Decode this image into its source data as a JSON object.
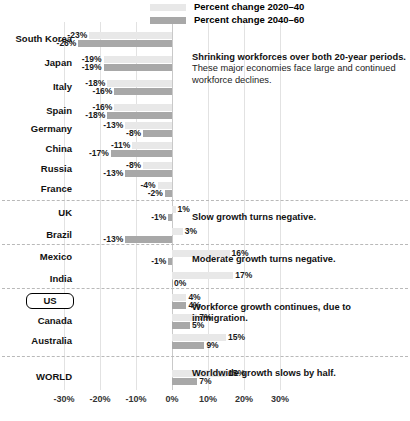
{
  "legend": {
    "items": [
      {
        "label": "Percent change 2020–40",
        "color": "#e8e8e8",
        "key": "s1"
      },
      {
        "label": "Percent change 2040–60",
        "color": "#a8a8a8",
        "key": "s2"
      }
    ]
  },
  "axis": {
    "ticks": [
      "-30%",
      "-20%",
      "-10%",
      "0%",
      "10%",
      "20%",
      "30%"
    ],
    "tick_values": [
      -30,
      -20,
      -10,
      0,
      10,
      20,
      30
    ]
  },
  "annotations": [
    {
      "id": "shrinking",
      "title": "Shrinking workforces over both 20-year periods.",
      "body": "These major economies face large and continued workforce declines."
    },
    {
      "id": "slow-growth",
      "title": "Slow growth turns negative.",
      "body": ""
    },
    {
      "id": "moderate-growth",
      "title": "Moderate growth turns negative.",
      "body": ""
    },
    {
      "id": "workforce-growth",
      "title": "Workforce growth continues, due to immigration.",
      "body": ""
    },
    {
      "id": "worldwide",
      "title": "Worldwide growth slows by half.",
      "body": ""
    }
  ],
  "chart_data": {
    "type": "bar",
    "orientation": "horizontal",
    "title": "",
    "xlabel": "",
    "ylabel": "",
    "xlim": [
      -30,
      35
    ],
    "grid": true,
    "legend_position": "top",
    "categories": [
      "South Korea",
      "Japan",
      "Italy",
      "Spain",
      "Germany",
      "China",
      "Russia",
      "France",
      "UK",
      "Brazil",
      "Mexico",
      "India",
      "US",
      "Canada",
      "Australia",
      "WORLD"
    ],
    "series": [
      {
        "name": "Percent change 2020–40",
        "color": "#e8e8e8",
        "values": [
          -23,
          -19,
          -18,
          -16,
          -13,
          -11,
          -8,
          -4,
          1,
          3,
          16,
          17,
          4,
          7,
          15,
          15
        ],
        "labels": [
          "-23%",
          "-19%",
          "-18%",
          "-16%",
          "-13%",
          "-11%",
          "-8%",
          "-4%",
          "1%",
          "3%",
          "16%",
          "17%",
          "4%",
          "7%",
          "15%",
          "15%"
        ]
      },
      {
        "name": "Percent change 2040–60",
        "color": "#a8a8a8",
        "values": [
          -26,
          -19,
          -16,
          -18,
          -8,
          -17,
          -13,
          -2,
          -1,
          -13,
          -1,
          0,
          4,
          5,
          9,
          7
        ],
        "labels": [
          "-26%",
          "-19%",
          "-16%",
          "-18%",
          "-8%",
          "-17%",
          "-13%",
          "-2%",
          "-1%",
          "-13%",
          "-1%",
          "0%",
          "4%",
          "5%",
          "9%",
          "7%"
        ]
      }
    ],
    "highlighted_category": "US",
    "groups": [
      {
        "name": "shrinking",
        "categories": [
          "South Korea",
          "Japan",
          "Italy",
          "Spain",
          "Germany",
          "China",
          "Russia",
          "France"
        ]
      },
      {
        "name": "slow-growth",
        "categories": [
          "UK",
          "Brazil"
        ]
      },
      {
        "name": "moderate-growth",
        "categories": [
          "Mexico",
          "India"
        ]
      },
      {
        "name": "workforce-growth",
        "categories": [
          "US",
          "Canada",
          "Australia"
        ]
      },
      {
        "name": "worldwide",
        "categories": [
          "WORLD"
        ]
      }
    ]
  }
}
